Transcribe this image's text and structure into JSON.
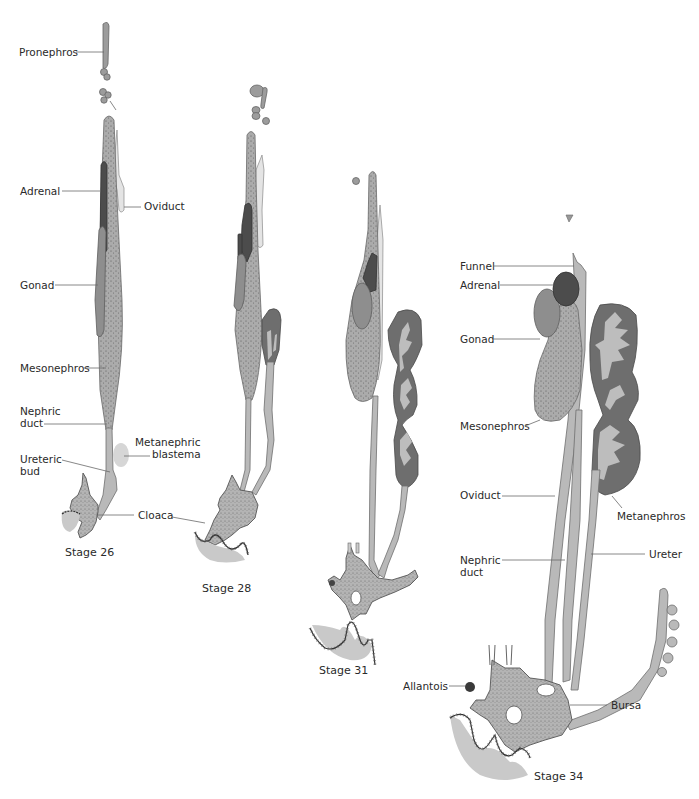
{
  "figure": {
    "stages": [
      {
        "id": "stage-26",
        "label": "Stage 26",
        "annotations": [
          {
            "key": "pronephros",
            "text": "Pronephros"
          },
          {
            "key": "adrenal",
            "text": "Adrenal"
          },
          {
            "key": "oviduct",
            "text": "Oviduct"
          },
          {
            "key": "gonad",
            "text": "Gonad"
          },
          {
            "key": "mesonephros",
            "text": "Mesonephros"
          },
          {
            "key": "nephric_duct_1",
            "text": "Nephric"
          },
          {
            "key": "nephric_duct_2",
            "text": "duct"
          },
          {
            "key": "metanephric_blastema_1",
            "text": "Metanephric"
          },
          {
            "key": "metanephric_blastema_2",
            "text": "blastema"
          },
          {
            "key": "ureteric_bud_1",
            "text": "Ureteric"
          },
          {
            "key": "ureteric_bud_2",
            "text": "bud"
          },
          {
            "key": "cloaca",
            "text": "Cloaca"
          }
        ]
      },
      {
        "id": "stage-28",
        "label": "Stage 28",
        "annotations": []
      },
      {
        "id": "stage-31",
        "label": "Stage 31",
        "annotations": []
      },
      {
        "id": "stage-34",
        "label": "Stage 34",
        "annotations": [
          {
            "key": "funnel",
            "text": "Funnel"
          },
          {
            "key": "adrenal",
            "text": "Adrenal"
          },
          {
            "key": "gonad",
            "text": "Gonad"
          },
          {
            "key": "mesonephros",
            "text": "Mesonephros"
          },
          {
            "key": "oviduct",
            "text": "Oviduct"
          },
          {
            "key": "metanephros",
            "text": "Metanephros"
          },
          {
            "key": "nephric_duct_1",
            "text": "Nephric"
          },
          {
            "key": "nephric_duct_2",
            "text": "duct"
          },
          {
            "key": "ureter",
            "text": "Ureter"
          },
          {
            "key": "allantois",
            "text": "Allantois"
          },
          {
            "key": "bursa",
            "text": "Bursa"
          }
        ]
      }
    ],
    "colors": {
      "background": "#ffffff",
      "duct": "#b9b9b9",
      "mesonephros": "#a8a8a8",
      "gonad": "#8e8e8e",
      "adrenal": "#4c4c4c",
      "metanephros": "#6e6e6e",
      "text": "#2a2a2a"
    }
  }
}
